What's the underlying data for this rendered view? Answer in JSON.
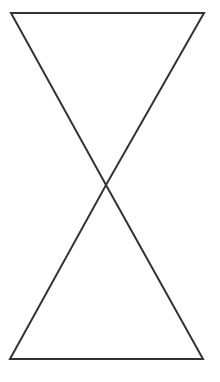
{
  "diagram": {
    "type": "hourglass-shape",
    "stroke_color": "#333333",
    "stroke_width": 2,
    "background": "#ffffff",
    "points": {
      "top_left": [
        11,
        13
      ],
      "top_right": [
        204,
        13
      ],
      "center": [
        106,
        185
      ],
      "bottom_left": [
        10,
        359
      ],
      "bottom_right": [
        203,
        359
      ]
    }
  }
}
